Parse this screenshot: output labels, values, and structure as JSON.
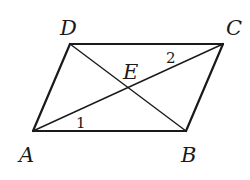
{
  "diagram": {
    "type": "parallelogram-with-diagonals",
    "points": {
      "A": {
        "label": "A",
        "x": 33,
        "y": 131
      },
      "B": {
        "label": "B",
        "x": 186,
        "y": 131
      },
      "C": {
        "label": "C",
        "x": 223,
        "y": 44
      },
      "D": {
        "label": "D",
        "x": 70,
        "y": 44
      },
      "E": {
        "label": "E",
        "x": 128,
        "y": 88
      }
    },
    "angle_labels": {
      "angle1": "1",
      "angle2": "2"
    },
    "colors": {
      "stroke": "#1a1a1a",
      "background": "#ffffff"
    }
  }
}
